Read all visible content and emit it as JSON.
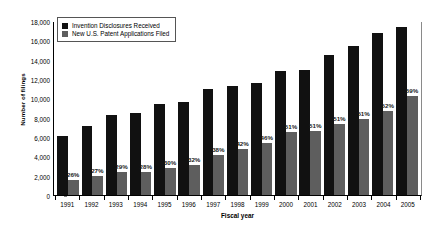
{
  "chart_data": {
    "type": "bar",
    "title": "",
    "xlabel": "Fiscal year",
    "ylabel": "Number of filings",
    "ylim": [
      0,
      18000
    ],
    "ytick_values": [
      0,
      2000,
      4000,
      6000,
      8000,
      10000,
      12000,
      14000,
      16000,
      18000
    ],
    "ytick_labels": [
      "0",
      "2,000",
      "4,000",
      "6,000",
      "8,000",
      "10,000",
      "12,000",
      "14,000",
      "16,000",
      "18,000"
    ],
    "grid": false,
    "legend_position": "upper-left",
    "categories": [
      "1991",
      "1992",
      "1993",
      "1994",
      "1995",
      "1996",
      "1997",
      "1998",
      "1999",
      "2000",
      "2001",
      "2002",
      "2003",
      "2004",
      "2005"
    ],
    "series": [
      {
        "name": "Invention Disclosures Received",
        "color": "#111111",
        "values": [
          6100,
          7100,
          8300,
          8500,
          9400,
          9600,
          11000,
          11300,
          11600,
          12800,
          12900,
          14500,
          15400,
          16800,
          17400
        ]
      },
      {
        "name": "New U.S. Patent Applications Filed",
        "color": "#5e5e5e",
        "values": [
          1586,
          1917,
          2407,
          2380,
          2820,
          3072,
          4180,
          4746,
          5336,
          6528,
          6579,
          7395,
          7854,
          8736,
          10266
        ]
      }
    ],
    "annotations": [
      "26%",
      "27%",
      "29%",
      "28%",
      "30%",
      "32%",
      "38%",
      "42%",
      "46%",
      "51%",
      "51%",
      "51%",
      "51%",
      "52%",
      "59%"
    ]
  }
}
